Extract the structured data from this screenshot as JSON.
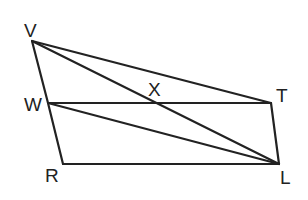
{
  "diagram": {
    "type": "geometry",
    "points": {
      "V": {
        "x": 32,
        "y": 41,
        "label": "V",
        "lx": 24,
        "ly": 37
      },
      "W": {
        "x": 48,
        "y": 103,
        "label": "W",
        "lx": 24,
        "ly": 111
      },
      "R": {
        "x": 63,
        "y": 164,
        "label": "R",
        "lx": 45,
        "ly": 182
      },
      "L": {
        "x": 279,
        "y": 164,
        "label": "L",
        "lx": 280,
        "ly": 184
      },
      "T": {
        "x": 271,
        "y": 103,
        "label": "T",
        "lx": 276,
        "ly": 102
      },
      "X": {
        "x": 157,
        "y": 101,
        "label": "X",
        "lx": 148,
        "ly": 96
      }
    },
    "segments": [
      [
        "V",
        "W"
      ],
      [
        "W",
        "R"
      ],
      [
        "R",
        "L"
      ],
      [
        "L",
        "T"
      ],
      [
        "T",
        "W"
      ],
      [
        "V",
        "T"
      ],
      [
        "V",
        "L"
      ],
      [
        "W",
        "L"
      ]
    ],
    "labels": [
      "V",
      "W",
      "R",
      "L",
      "T",
      "X"
    ]
  }
}
